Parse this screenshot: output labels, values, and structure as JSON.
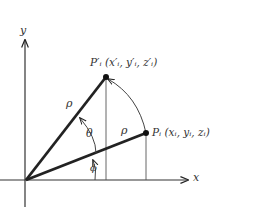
{
  "axes": {
    "x_label": "x",
    "y_label": "y"
  },
  "points": {
    "p_prime": {
      "label": "P′ᵢ (x′ᵢ, y′ᵢ, z′ᵢ)"
    },
    "p": {
      "label": "Pᵢ (xᵢ, yᵢ, zᵢ)"
    }
  },
  "segments": {
    "rho_upper": "ρ",
    "rho_lower": "ρ"
  },
  "angles": {
    "theta": "θ",
    "phi": "ϕ"
  },
  "colors": {
    "ink": "#222222",
    "thin": "#555555"
  }
}
